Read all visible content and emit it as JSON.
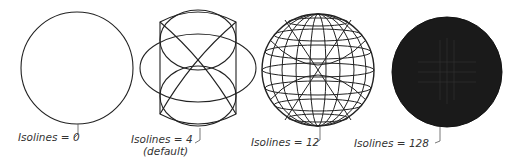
{
  "figure": {
    "panels": [
      {
        "isolines": 0,
        "label": "Isolines = 0",
        "note": ""
      },
      {
        "isolines": 4,
        "label": "Isolines = 4",
        "note": "(default)"
      },
      {
        "isolines": 12,
        "label": "Isolines = 12",
        "note": ""
      },
      {
        "isolines": 128,
        "label": "Isolines = 128",
        "note": ""
      }
    ],
    "colors": {
      "line": "#222222",
      "fill_dense": "#1a1a1a",
      "background": "#ffffff",
      "label_text": "#333333"
    }
  }
}
